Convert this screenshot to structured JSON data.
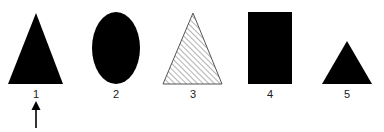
{
  "figure": {
    "background_color": "#ffffff",
    "fill_color": "#000000",
    "outline_color": "#555555",
    "hatch_color": "#666666",
    "label_color": "#1a1a1a",
    "width": 384,
    "height": 132
  },
  "shapes": [
    {
      "id": "shape-1",
      "label": "1",
      "type": "triangle",
      "fill": "solid-black",
      "apex_x": 36,
      "apex_y": 13,
      "left_x": 8,
      "right_x": 63,
      "base_y": 84,
      "label_x": 36,
      "label_y": 89
    },
    {
      "id": "shape-2",
      "label": "2",
      "type": "ellipse",
      "fill": "solid-black",
      "center_x": 116,
      "center_y": 48,
      "radius_x": 24,
      "radius_y": 36,
      "label_x": 116,
      "label_y": 89
    },
    {
      "id": "shape-3",
      "label": "3",
      "type": "triangle",
      "fill": "diagonal-hatch",
      "apex_x": 193,
      "apex_y": 13,
      "left_x": 163,
      "right_x": 222,
      "base_y": 84,
      "label_x": 193,
      "label_y": 89
    },
    {
      "id": "shape-4",
      "label": "4",
      "type": "rectangle",
      "fill": "solid-black",
      "left_x": 248,
      "right_x": 292,
      "top_y": 12,
      "bottom_y": 84,
      "label_x": 270,
      "label_y": 89
    },
    {
      "id": "shape-5",
      "label": "5",
      "type": "triangle",
      "fill": "solid-black",
      "apex_x": 347,
      "apex_y": 41,
      "left_x": 322,
      "right_x": 372,
      "base_y": 84,
      "label_x": 347,
      "label_y": 89
    }
  ],
  "pointer": {
    "id": "arrow-pointer",
    "points_to": "1",
    "direction": "up",
    "tip_x": 36,
    "tip_y": 101,
    "tail_y": 128,
    "head_width": 9,
    "head_height": 9,
    "stem_width": 1.6,
    "color": "#000000"
  }
}
